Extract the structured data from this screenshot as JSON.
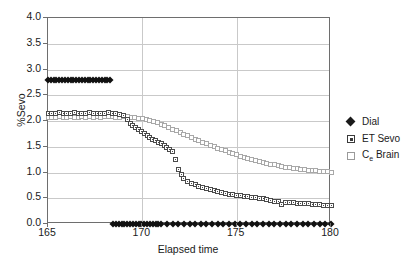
{
  "chart_data": {
    "type": "scatter",
    "title": "",
    "xlabel": "Elapsed time",
    "ylabel": "%Sevo",
    "xlim": [
      165,
      180
    ],
    "ylim": [
      0.0,
      4.0
    ],
    "xticks": [
      "165",
      "170",
      "175",
      "180"
    ],
    "yticks": [
      "0.0",
      "0.5",
      "1.0",
      "1.5",
      "2.0",
      "2.5",
      "3.0",
      "3.5",
      "4.0"
    ],
    "grid": "horizontal-and-vertical",
    "legend_position": "right",
    "series": [
      {
        "name": "Dial",
        "marker": "filled-diamond",
        "color": "#111111",
        "x": [
          165.0,
          165.15,
          165.3,
          165.45,
          165.6,
          165.75,
          165.9,
          166.05,
          166.2,
          166.35,
          166.5,
          166.65,
          166.8,
          166.95,
          167.1,
          167.25,
          167.4,
          167.55,
          167.7,
          167.85,
          168.0,
          168.15,
          168.3,
          168.45,
          168.6,
          168.75,
          168.9,
          169.05,
          169.2,
          169.35,
          169.5,
          169.65,
          169.8,
          169.95,
          170.1,
          170.25,
          170.4,
          170.55,
          170.7,
          170.85,
          171.0,
          171.3,
          171.6,
          171.9,
          172.2,
          172.5,
          172.8,
          173.1,
          173.4,
          173.7,
          174.0,
          174.3,
          174.6,
          174.9,
          175.2,
          175.5,
          175.8,
          176.1,
          176.4,
          176.7,
          177.0,
          177.3,
          177.6,
          177.9,
          178.2,
          178.5,
          178.8,
          179.1,
          179.4,
          179.7,
          180.0
        ],
        "y": [
          2.8,
          2.8,
          2.8,
          2.8,
          2.8,
          2.8,
          2.8,
          2.8,
          2.8,
          2.8,
          2.8,
          2.8,
          2.8,
          2.8,
          2.8,
          2.8,
          2.8,
          2.8,
          2.8,
          2.8,
          2.8,
          2.8,
          2.8,
          0.0,
          0.0,
          0.0,
          0.0,
          0.0,
          0.0,
          0.0,
          0.0,
          0.0,
          0.0,
          0.0,
          0.0,
          0.0,
          0.0,
          0.0,
          0.0,
          0.0,
          0.0,
          0.0,
          0.0,
          0.0,
          0.0,
          0.0,
          0.0,
          0.0,
          0.0,
          0.0,
          0.0,
          0.0,
          0.0,
          0.0,
          0.0,
          0.0,
          0.0,
          0.0,
          0.0,
          0.0,
          0.0,
          0.0,
          0.0,
          0.0,
          0.0,
          0.0,
          0.0,
          0.0,
          0.0,
          0.0,
          0.0
        ]
      },
      {
        "name": "ET Sevo",
        "marker": "dotted-square",
        "color": "#4a4a4a",
        "x": [
          165.0,
          165.2,
          165.4,
          165.6,
          165.8,
          166.0,
          166.2,
          166.4,
          166.6,
          166.8,
          167.0,
          167.2,
          167.4,
          167.6,
          167.8,
          168.0,
          168.2,
          168.4,
          168.6,
          168.8,
          169.0,
          169.2,
          169.35,
          169.5,
          169.65,
          169.8,
          169.95,
          170.1,
          170.25,
          170.4,
          170.55,
          170.7,
          170.85,
          171.0,
          171.15,
          171.3,
          171.45,
          171.6,
          171.75,
          171.9,
          172.05,
          172.2,
          172.4,
          172.6,
          172.8,
          173.0,
          173.2,
          173.4,
          173.6,
          173.8,
          174.0,
          174.2,
          174.4,
          174.6,
          174.8,
          175.0,
          175.2,
          175.4,
          175.6,
          175.8,
          176.0,
          176.2,
          176.4,
          176.6,
          176.8,
          177.0,
          177.2,
          177.4,
          177.6,
          177.8,
          178.0,
          178.2,
          178.4,
          178.6,
          178.8,
          179.0,
          179.2,
          179.4,
          179.6,
          179.8,
          180.0
        ],
        "y": [
          2.14,
          2.15,
          2.15,
          2.16,
          2.15,
          2.15,
          2.14,
          2.16,
          2.15,
          2.14,
          2.15,
          2.16,
          2.15,
          2.15,
          2.14,
          2.15,
          2.16,
          2.15,
          2.14,
          2.13,
          2.1,
          2.02,
          1.96,
          1.92,
          1.88,
          1.84,
          1.8,
          1.76,
          1.72,
          1.68,
          1.64,
          1.62,
          1.59,
          1.56,
          1.52,
          1.49,
          1.44,
          1.4,
          1.25,
          1.06,
          0.96,
          0.88,
          0.83,
          0.79,
          0.76,
          0.73,
          0.71,
          0.69,
          0.67,
          0.65,
          0.63,
          0.61,
          0.6,
          0.58,
          0.57,
          0.56,
          0.55,
          0.54,
          0.53,
          0.52,
          0.51,
          0.5,
          0.49,
          0.47,
          0.45,
          0.44,
          0.43,
          0.38,
          0.42,
          0.41,
          0.41,
          0.4,
          0.4,
          0.39,
          0.39,
          0.38,
          0.38,
          0.37,
          0.36,
          0.36,
          0.35
        ]
      },
      {
        "name": "Ce Brain",
        "marker": "open-square",
        "color": "#a8a8a8",
        "x": [
          165.0,
          165.2,
          165.4,
          165.6,
          165.8,
          166.0,
          166.2,
          166.4,
          166.6,
          166.8,
          167.0,
          167.2,
          167.4,
          167.6,
          167.8,
          168.0,
          168.2,
          168.4,
          168.6,
          168.8,
          169.0,
          169.2,
          169.4,
          169.6,
          169.8,
          170.0,
          170.2,
          170.4,
          170.6,
          170.8,
          171.0,
          171.2,
          171.4,
          171.6,
          171.8,
          172.0,
          172.2,
          172.4,
          172.6,
          172.8,
          173.0,
          173.2,
          173.4,
          173.6,
          173.8,
          174.0,
          174.2,
          174.4,
          174.6,
          174.8,
          175.0,
          175.2,
          175.4,
          175.6,
          175.8,
          176.0,
          176.2,
          176.4,
          176.6,
          176.8,
          177.0,
          177.2,
          177.4,
          177.6,
          177.8,
          178.0,
          178.2,
          178.4,
          178.6,
          178.8,
          179.0,
          179.2,
          179.4,
          179.6,
          179.8,
          180.0
        ],
        "y": [
          2.07,
          2.07,
          2.07,
          2.08,
          2.07,
          2.07,
          2.08,
          2.07,
          2.07,
          2.08,
          2.07,
          2.08,
          2.07,
          2.08,
          2.07,
          2.08,
          2.08,
          2.08,
          2.07,
          2.07,
          2.08,
          2.08,
          2.07,
          2.06,
          2.05,
          2.04,
          2.03,
          2.01,
          1.99,
          1.97,
          1.94,
          1.91,
          1.88,
          1.84,
          1.81,
          1.78,
          1.74,
          1.71,
          1.68,
          1.65,
          1.62,
          1.59,
          1.56,
          1.53,
          1.5,
          1.47,
          1.44,
          1.42,
          1.39,
          1.37,
          1.34,
          1.32,
          1.3,
          1.28,
          1.26,
          1.24,
          1.22,
          1.2,
          1.18,
          1.16,
          1.15,
          1.13,
          1.12,
          1.1,
          1.09,
          1.08,
          1.07,
          1.06,
          1.05,
          1.04,
          1.04,
          1.03,
          1.02,
          1.02,
          1.01,
          1.0
        ]
      }
    ]
  },
  "axes": {
    "ylabel": "%Sevo",
    "xlabel": "Elapsed time",
    "yticks": [
      "4.0",
      "3.5",
      "3.0",
      "2.5",
      "2.0",
      "1.5",
      "1.0",
      "0.5",
      "0.0"
    ],
    "xticks": [
      "165",
      "170",
      "175",
      "180"
    ]
  },
  "legend": {
    "items": [
      {
        "label": "Dial",
        "marker": "filled-diamond"
      },
      {
        "label": "ET Sevo",
        "marker": "dotted-square"
      },
      {
        "label_main": "C",
        "label_sub": "e",
        "label_tail": " Brain",
        "marker": "open-square"
      }
    ]
  }
}
